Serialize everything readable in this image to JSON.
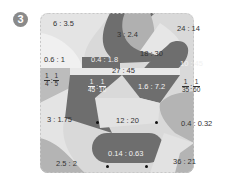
{
  "exercise_number": "3",
  "colors": {
    "light": "#e2e2e2",
    "mid": "#b4b4b4",
    "dark": "#6e6e6e",
    "frame": "#c8c8c8"
  },
  "regions": [
    {
      "id": "r1",
      "label": "6 : 3.5"
    },
    {
      "id": "r2",
      "label": "3 : 2.4"
    },
    {
      "id": "r3",
      "label": "24 : 14"
    },
    {
      "id": "r4",
      "label": "0.6 : 1"
    },
    {
      "id": "r5",
      "label": "0.4 : 1.8"
    },
    {
      "id": "r6",
      "label": "18 : 30"
    },
    {
      "id": "r7",
      "label": "27 : 45"
    },
    {
      "id": "r8",
      "label": "10 : 45"
    },
    {
      "id": "r9",
      "label": "1.6 : 7.2"
    },
    {
      "id": "r10",
      "label": "3 : 1.75"
    },
    {
      "id": "r11",
      "label": "12 : 20"
    },
    {
      "id": "r12",
      "label": "0.4 : 0.32"
    },
    {
      "id": "r13",
      "label": "0.14 : 0.63"
    },
    {
      "id": "r14",
      "label": "2.5 : 2"
    },
    {
      "id": "r15",
      "label": "36 : 21"
    }
  ],
  "fractions": [
    {
      "id": "f1",
      "a": {
        "n": "1",
        "d": "4"
      },
      "b": {
        "n": "1",
        "d": "5"
      }
    },
    {
      "id": "f2",
      "a": {
        "n": "1",
        "d": "45"
      },
      "b": {
        "n": "1",
        "d": "10"
      }
    },
    {
      "id": "f3",
      "a": {
        "n": "1",
        "d": "35"
      },
      "b": {
        "n": "1",
        "d": "60"
      }
    }
  ],
  "colon": ":"
}
